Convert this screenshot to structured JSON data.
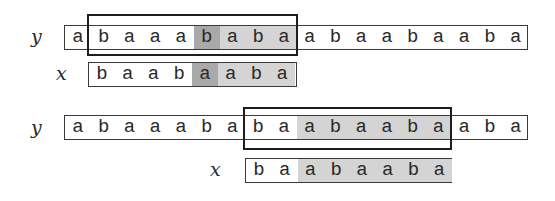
{
  "colors": {
    "light_shade": "#d4d4d4",
    "dark_shade": "#a9a9a9",
    "border": "#3a3a3a",
    "window_border": "#1e1e1e"
  },
  "top": {
    "y_label": "y",
    "x_label": "x",
    "y_string": [
      "a",
      "b",
      "a",
      "a",
      "a",
      "b",
      "a",
      "b",
      "a",
      "a",
      "b",
      "a",
      "a",
      "b",
      "a",
      "a",
      "b",
      "a"
    ],
    "y_shading": [
      "",
      "",
      "",
      "",
      "",
      "dark",
      "light",
      "light",
      "light",
      "",
      "",
      "",
      "",
      "",
      "",
      "",
      "",
      ""
    ],
    "window": {
      "start_index": 1,
      "length": 8
    },
    "x_string": [
      "b",
      "a",
      "a",
      "b",
      "a",
      "a",
      "b",
      "a"
    ],
    "x_shading": [
      "",
      "",
      "",
      "",
      "dark",
      "light",
      "light",
      "light"
    ]
  },
  "bottom": {
    "y_label": "y",
    "x_label": "x",
    "y_string": [
      "a",
      "b",
      "a",
      "a",
      "a",
      "b",
      "a",
      "b",
      "a",
      "a",
      "b",
      "a",
      "a",
      "b",
      "a",
      "a",
      "b",
      "a"
    ],
    "y_shading": [
      "",
      "",
      "",
      "",
      "",
      "",
      "",
      "",
      "",
      "light",
      "light",
      "light",
      "light",
      "light",
      "light",
      "",
      "",
      ""
    ],
    "window": {
      "start_index": 7,
      "length": 8
    },
    "x_string": [
      "b",
      "a",
      "a",
      "b",
      "a",
      "a",
      "b",
      "a"
    ],
    "x_shading": [
      "",
      "",
      "light",
      "light",
      "light",
      "light",
      "light",
      "light"
    ]
  }
}
